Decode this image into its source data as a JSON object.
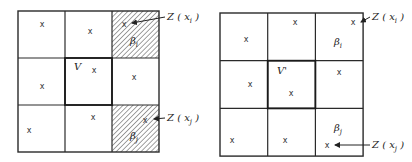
{
  "figure": {
    "panels": [
      {
        "id": "left",
        "grid": {
          "x0": 18,
          "y0": 11,
          "cell": 47,
          "rows": 3,
          "cols": 3
        },
        "center_label": "V",
        "center_label_pos": [
          74,
          70
        ],
        "hatched_cells": [
          [
            0,
            2
          ],
          [
            2,
            2
          ]
        ],
        "points": [
          {
            "x": 42,
            "y": 24
          },
          {
            "x": 90,
            "y": 31
          },
          {
            "x": 124,
            "y": 24
          },
          {
            "x": 42,
            "y": 86
          },
          {
            "x": 94,
            "y": 70
          },
          {
            "x": 134,
            "y": 77
          },
          {
            "x": 29,
            "y": 130
          },
          {
            "x": 93,
            "y": 117
          },
          {
            "x": 145,
            "y": 120
          }
        ],
        "cell_labels": [
          {
            "text": "β",
            "sub": "i",
            "x": 130,
            "y": 44
          },
          {
            "text": "β",
            "sub": "j",
            "x": 130,
            "y": 139
          }
        ],
        "annotations": [
          {
            "main": "Z",
            "open": "(",
            "var": "x",
            "sub": "i",
            "close": ")",
            "x": 167,
            "y": 20,
            "target": [
              128,
              23
            ]
          },
          {
            "main": "Z",
            "open": "(",
            "var": "x",
            "sub": "j",
            "close": ")",
            "x": 167,
            "y": 121,
            "target": [
              150,
              119
            ]
          }
        ]
      },
      {
        "id": "right",
        "grid": {
          "x0": 220,
          "y0": 13,
          "cell": 47.7,
          "rows": 3,
          "cols": 3
        },
        "center_label": "V'",
        "center_label_pos": [
          277,
          74
        ],
        "hatched_cells": [],
        "points": [
          {
            "x": 246,
            "y": 39
          },
          {
            "x": 295,
            "y": 22
          },
          {
            "x": 353,
            "y": 22
          },
          {
            "x": 250,
            "y": 84
          },
          {
            "x": 291,
            "y": 93
          },
          {
            "x": 339,
            "y": 72
          },
          {
            "x": 232,
            "y": 140
          },
          {
            "x": 285,
            "y": 140
          },
          {
            "x": 327,
            "y": 145
          }
        ],
        "cell_labels": [
          {
            "text": "β",
            "sub": "i",
            "x": 334,
            "y": 45
          },
          {
            "text": "β",
            "sub": "j",
            "x": 334,
            "y": 131
          }
        ],
        "annotations": [
          {
            "main": "Z",
            "open": "(",
            "var": "x",
            "sub": "i",
            "close": ")",
            "x": 372,
            "y": 20,
            "target": [
              357,
              22
            ]
          },
          {
            "main": "Z",
            "open": "(",
            "var": "x",
            "sub": "j",
            "close": ")",
            "x": 372,
            "y": 148,
            "target": [
              331,
              145
            ]
          }
        ]
      }
    ],
    "point_marker": "x"
  }
}
